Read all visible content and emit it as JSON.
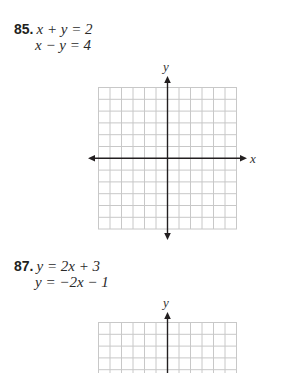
{
  "problems": [
    {
      "number": "85.",
      "equations": [
        "x + y = 2",
        "x − y = 4"
      ],
      "graph": {
        "x_axis_label": "x",
        "y_axis_label": "y",
        "grid_cols": 12,
        "grid_rows": 12
      }
    },
    {
      "number": "87.",
      "equations": [
        "y = 2x + 3",
        "y = −2x − 1"
      ],
      "graph": {
        "y_axis_label": "y",
        "grid_cols": 12,
        "grid_rows_visible": 4
      }
    }
  ],
  "colors": {
    "text": "#231f20",
    "grid_line": "#c8c8c8",
    "axis": "#231f20"
  }
}
